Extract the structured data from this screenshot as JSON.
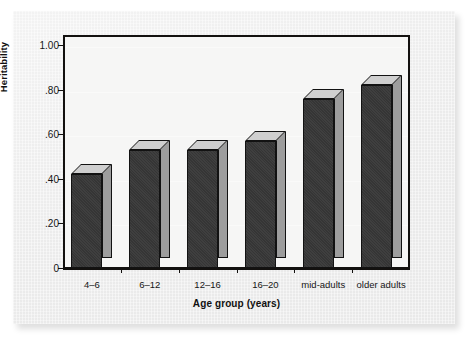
{
  "chart_data": {
    "type": "bar",
    "title": "",
    "subtitle": "",
    "xlabel": "Age group (years)",
    "ylabel": "Heritability",
    "categories": [
      "4–6",
      "6–12",
      "12–16",
      "16–20",
      "mid-adults",
      "older adults"
    ],
    "values": [
      0.42,
      0.53,
      0.53,
      0.57,
      0.76,
      0.82
    ],
    "ylim": [
      0,
      1.0
    ],
    "ytick_values": [
      0,
      0.2,
      0.4,
      0.6,
      0.8,
      1.0
    ],
    "ytick_labels": [
      "0",
      ".20",
      ".40",
      ".60",
      ".80",
      "1.00"
    ],
    "grid": true,
    "legend": false,
    "legend_position": "none",
    "style": "3d-bar",
    "annotations": []
  },
  "colors": {
    "bar_front": "#383838",
    "bar_side": "#9d9d9d",
    "bar_top": "#cfcfcf",
    "axis": "#13110f",
    "plot_background": "#f6f6f5",
    "page_background": "#ffffff",
    "card_background": "#efefef",
    "text": "#151515"
  }
}
